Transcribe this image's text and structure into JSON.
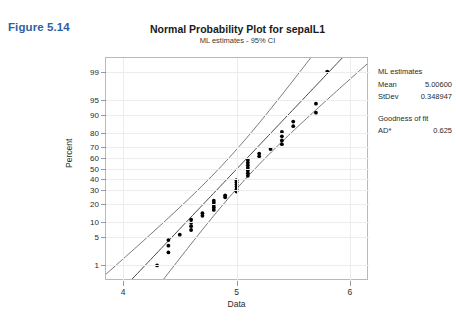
{
  "figure_label": "Figure 5.14",
  "legend": {
    "estimates_header": "ML estimates",
    "mean_label": "Mean",
    "mean_value": "5.00600",
    "stdev_label": "StDev",
    "stdev_value": "0.348947",
    "gof_header": "Goodness of fit",
    "ad_label": "AD*",
    "ad_value": "0.625"
  },
  "chart_data": {
    "type": "scatter",
    "title": "Normal Probability Plot for sepalL1",
    "subtitle": "ML estimates - 95% CI",
    "xlabel": "Data",
    "ylabel": "Percent",
    "grid": true,
    "legend_position": "right",
    "xlim": [
      3.85,
      6.15
    ],
    "xticks": [
      4,
      5,
      6
    ],
    "xtick_labels": [
      "4",
      "5",
      "6"
    ],
    "yticks_percent": [
      1,
      5,
      10,
      20,
      30,
      40,
      50,
      60,
      70,
      80,
      90,
      95,
      99
    ],
    "ytick_labels": [
      "1",
      "5",
      "10",
      "20",
      "30",
      "40",
      "50",
      "60",
      "70",
      "80",
      "90",
      "95",
      "99"
    ],
    "fit": {
      "name": "ML normal fit line",
      "mean": 5.006,
      "stdev": 0.348947
    },
    "confidence_interval": {
      "name": "95% CI",
      "level": 95
    },
    "series": [
      {
        "name": "sepalL1 percentiles",
        "points": [
          {
            "x": 4.3,
            "p": 1.0
          },
          {
            "x": 4.4,
            "p": 2.2
          },
          {
            "x": 4.4,
            "p": 3.2
          },
          {
            "x": 4.4,
            "p": 4.3
          },
          {
            "x": 4.5,
            "p": 5.6
          },
          {
            "x": 4.6,
            "p": 7.0
          },
          {
            "x": 4.6,
            "p": 8.3
          },
          {
            "x": 4.6,
            "p": 9.6
          },
          {
            "x": 4.6,
            "p": 11.0
          },
          {
            "x": 4.7,
            "p": 12.8
          },
          {
            "x": 4.7,
            "p": 14.2
          },
          {
            "x": 4.8,
            "p": 16.0
          },
          {
            "x": 4.8,
            "p": 17.5
          },
          {
            "x": 4.8,
            "p": 19.0
          },
          {
            "x": 4.8,
            "p": 20.5
          },
          {
            "x": 4.8,
            "p": 22.0
          },
          {
            "x": 4.9,
            "p": 24.5
          },
          {
            "x": 4.9,
            "p": 26.0
          },
          {
            "x": 5.0,
            "p": 29.0
          },
          {
            "x": 5.0,
            "p": 31.0
          },
          {
            "x": 5.0,
            "p": 33.0
          },
          {
            "x": 5.0,
            "p": 35.0
          },
          {
            "x": 5.0,
            "p": 37.0
          },
          {
            "x": 5.0,
            "p": 39.0
          },
          {
            "x": 5.1,
            "p": 43.0
          },
          {
            "x": 5.1,
            "p": 45.5
          },
          {
            "x": 5.1,
            "p": 48.0
          },
          {
            "x": 5.1,
            "p": 50.5
          },
          {
            "x": 5.1,
            "p": 53.0
          },
          {
            "x": 5.1,
            "p": 55.5
          },
          {
            "x": 5.1,
            "p": 58.0
          },
          {
            "x": 5.2,
            "p": 61.5
          },
          {
            "x": 5.2,
            "p": 64.0
          },
          {
            "x": 5.3,
            "p": 68.0
          },
          {
            "x": 5.4,
            "p": 72.0
          },
          {
            "x": 5.4,
            "p": 75.0
          },
          {
            "x": 5.4,
            "p": 78.0
          },
          {
            "x": 5.4,
            "p": 81.0
          },
          {
            "x": 5.5,
            "p": 84.5
          },
          {
            "x": 5.5,
            "p": 87.0
          },
          {
            "x": 5.7,
            "p": 91.0
          },
          {
            "x": 5.7,
            "p": 94.0
          },
          {
            "x": 5.8,
            "p": 99.0
          }
        ]
      }
    ]
  }
}
